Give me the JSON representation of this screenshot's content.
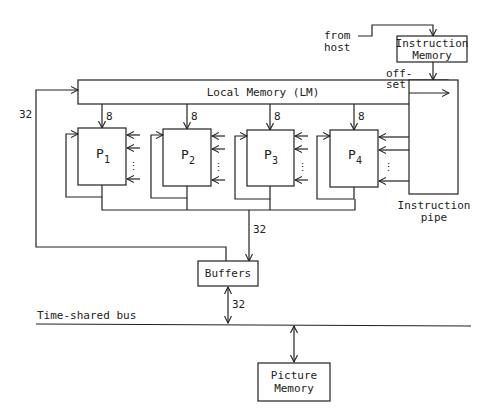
{
  "diagram": {
    "source_label": [
      "from",
      "host"
    ],
    "instruction_memory": [
      "Instruction",
      "Memory"
    ],
    "offset_label": [
      "off-",
      "set"
    ],
    "local_memory": "Local Memory (LM)",
    "instruction_pipe": [
      "Instruction",
      "pipe"
    ],
    "processors": [
      {
        "name": "P",
        "index": "1"
      },
      {
        "name": "P",
        "index": "2"
      },
      {
        "name": "P",
        "index": "3"
      },
      {
        "name": "P",
        "index": "4"
      }
    ],
    "lm_to_proc_width": "8",
    "feedback_width": "32",
    "proc_bus_width": "32",
    "buffers": "Buffers",
    "buffers_bus_width": "32",
    "bus_label": "Time-shared bus",
    "picture_memory": [
      "Picture",
      "Memory"
    ],
    "dots": "⋮"
  },
  "colors": {
    "line": "#222222",
    "background": "#ffffff"
  }
}
